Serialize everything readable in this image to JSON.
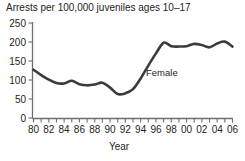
{
  "chart_data": {
    "type": "line",
    "title": "Arrests per 100,000 juveniles ages 10–17",
    "xlabel": "Year",
    "ylabel": "",
    "ylim": [
      0,
      250
    ],
    "yticks": [
      0,
      50,
      100,
      150,
      200,
      250
    ],
    "ytick_labels": [
      "0",
      "50",
      "100",
      "150",
      "200",
      "250"
    ],
    "xlim": [
      1980,
      2006
    ],
    "xticks": [
      1980,
      1981,
      1982,
      1983,
      1984,
      1985,
      1986,
      1987,
      1988,
      1989,
      1990,
      1991,
      1992,
      1993,
      1994,
      1995,
      1996,
      1997,
      1998,
      1999,
      2000,
      2001,
      2002,
      2003,
      2004,
      2005,
      2006
    ],
    "xtick_labels": [
      "80",
      "",
      "82",
      "",
      "84",
      "",
      "86",
      "",
      "88",
      "",
      "90",
      "",
      "92",
      "",
      "94",
      "",
      "96",
      "",
      "98",
      "",
      "00",
      "",
      "02",
      "",
      "04",
      "",
      "06"
    ],
    "grid": false,
    "legend_position": "inline-annotation",
    "series": [
      {
        "name": "Female",
        "annotation": "Female",
        "color": "#3b3b3d",
        "x": [
          1980,
          1981,
          1982,
          1983,
          1984,
          1985,
          1986,
          1987,
          1988,
          1989,
          1990,
          1991,
          1992,
          1993,
          1994,
          1995,
          1996,
          1997,
          1998,
          1999,
          2000,
          2001,
          2002,
          2003,
          2004,
          2005,
          2006
        ],
        "values": [
          127,
          113,
          101,
          92,
          91,
          98,
          89,
          86,
          88,
          93,
          80,
          63,
          65,
          76,
          104,
          138,
          170,
          198,
          189,
          188,
          189,
          195,
          192,
          186,
          196,
          201,
          188
        ]
      }
    ]
  },
  "axis_colors": {
    "axis": "#6d6e71",
    "text": "#231f20",
    "line": "#3b3b3d"
  }
}
